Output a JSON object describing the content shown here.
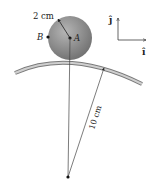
{
  "diagram": {
    "ball": {
      "radius_label": "2 cm",
      "center_label": "A",
      "point_label": "B",
      "fill": "#8e8e8e"
    },
    "track": {
      "radius_label": "10 cm",
      "fill": "#a9a9a9"
    },
    "axes": {
      "j_label": "ĵ",
      "i_label": "î"
    }
  }
}
